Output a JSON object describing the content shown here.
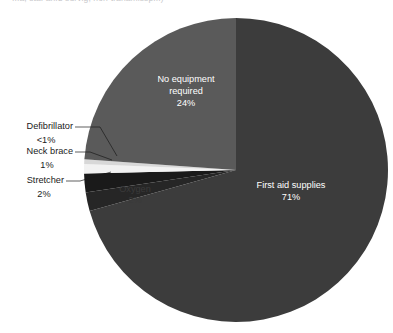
{
  "title_fragment": "...a, sta. an.d survig, non-tranamissp...)",
  "chart_data": {
    "type": "pie",
    "title": "",
    "subtitle": "",
    "xlabel": "",
    "ylabel": "",
    "legend_position": "none",
    "grid": false,
    "labels": [
      "First aid supplies",
      "Stretcher",
      "Oxygen",
      "Neck brace",
      "Defibrillator",
      "No equipment required"
    ],
    "values": [
      71,
      2,
      2,
      1,
      0.5,
      24
    ],
    "value_labels": [
      "71%",
      "2%",
      "2%",
      "1%",
      "<1%",
      "24%"
    ],
    "colors": [
      "#3c3c3c",
      "#262626",
      "#1a1a1a",
      "#f2f2f2",
      "#d8d8d8",
      "#5a5a5a"
    ],
    "slices": [
      {
        "name": "First aid supplies",
        "value": 71,
        "value_label": "71%",
        "color": "#3c3c3c",
        "label_placement": "inside",
        "label_x": 291,
        "label_y": 186,
        "pct_x": 291,
        "pct_y": 198,
        "text_tone": "on-dark"
      },
      {
        "name": "Stretcher",
        "value": 2,
        "value_label": "2%",
        "color": "#262626",
        "label_placement": "callout",
        "callout_text_x": 64,
        "callout_text_y": 181,
        "callout_pct_x": 44,
        "callout_pct_y": 195,
        "leader_path": "M66,181 L80,181 L111,172"
      },
      {
        "name": "Oxygen",
        "value": 2,
        "value_label": "2%",
        "color": "#1a1a1a",
        "label_placement": "inside",
        "label_x": 135,
        "label_y": 190,
        "pct_x": 135,
        "pct_y": 201,
        "text_tone": "on-darker"
      },
      {
        "name": "Neck brace",
        "value": 1,
        "value_label": "1%",
        "color": "#f2f2f2",
        "label_placement": "callout",
        "callout_text_x": 73,
        "callout_text_y": 152,
        "callout_pct_x": 47,
        "callout_pct_y": 166,
        "leader_path": "M75,152 L90,152 L112,160"
      },
      {
        "name": "Defibrillator",
        "value": 0.5,
        "value_label": "<1%",
        "color": "#d8d8d8",
        "label_placement": "callout",
        "callout_text_x": 73,
        "callout_text_y": 127,
        "callout_pct_x": 46,
        "callout_pct_y": 141,
        "leader_path": "M75,127 L100,127 L117,156"
      },
      {
        "name": "No equipment required",
        "value": 24,
        "value_label": "24%",
        "color": "#5a5a5a",
        "label_placement": "inside",
        "label_line1": "No equipment",
        "label_line2": "required",
        "label_x": 186,
        "label_y": 80,
        "label_x2": 186,
        "label_y2": 92,
        "pct_x": 186,
        "pct_y": 104,
        "text_tone": "on-dark"
      }
    ],
    "geometry": {
      "center_x": 236,
      "center_y": 170,
      "radius": 152
    }
  }
}
